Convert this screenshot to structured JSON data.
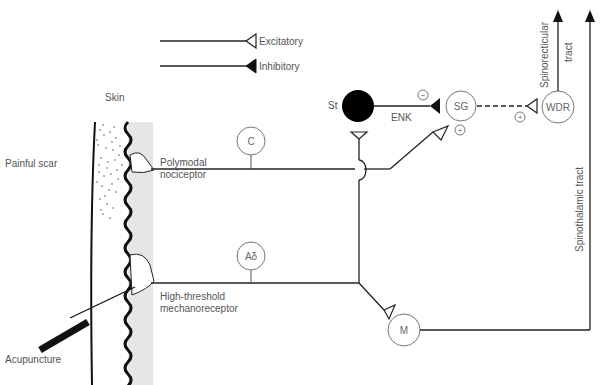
{
  "legend": {
    "excitatory": "Excitatory",
    "inhibitory": "Inhibitory"
  },
  "labels": {
    "skin": "Skin",
    "painful_scar": "Painful scar",
    "polymodal_1": "Polymodal",
    "polymodal_2": "nociceptor",
    "highthreshold_1": "High-threshold",
    "highthreshold_2": "mechanoreceptor",
    "acupuncture": "Acupuncture",
    "enk": "ENK",
    "st": "St",
    "spinoreticular_1": "Spinorecticular",
    "spinoreticular_2": "tract",
    "spinothalamic": "Spinothalamic tract"
  },
  "neurons": {
    "c": "C",
    "adelta": "Aδ",
    "sg": "SG",
    "wdr": "WDR",
    "m": "M"
  },
  "signs": {
    "minus": "−",
    "plus_sg": "+",
    "plus_wdr": "+"
  },
  "colors": {
    "stroke": "#1a1a1a",
    "skin_fill": "#e6e6e6",
    "text": "#555555"
  }
}
